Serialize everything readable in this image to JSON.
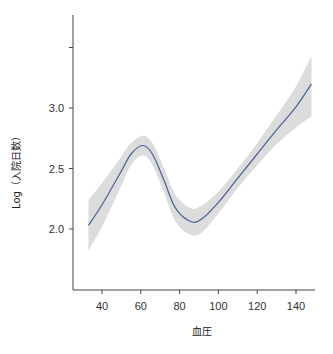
{
  "chart_data": {
    "type": "line",
    "subtype": "smoothed line with confidence band",
    "title": "",
    "xlabel": "血圧",
    "ylabel": "Log（入院日数）",
    "xlim": [
      26,
      152
    ],
    "ylim": [
      1.5,
      3.6
    ],
    "x_ticks": [
      40,
      60,
      80,
      100,
      120,
      140
    ],
    "y_ticks": [
      2.0,
      2.5,
      3.0,
      3.5
    ],
    "y_tick_labels": [
      "2.0",
      "2.5",
      "3.0",
      ""
    ],
    "grid": false,
    "legend": null,
    "series": [
      {
        "name": "fit",
        "color": "#4a5f9a",
        "x": [
          33,
          40,
          50,
          55,
          61,
          66,
          72,
          78,
          86,
          92,
          100,
          110,
          120,
          130,
          140,
          148
        ],
        "y": [
          2.03,
          2.2,
          2.48,
          2.62,
          2.69,
          2.62,
          2.4,
          2.17,
          2.06,
          2.09,
          2.22,
          2.42,
          2.62,
          2.82,
          3.01,
          3.2
        ],
        "lower": [
          1.82,
          2.02,
          2.36,
          2.53,
          2.61,
          2.53,
          2.3,
          2.06,
          1.95,
          1.98,
          2.13,
          2.34,
          2.53,
          2.7,
          2.84,
          2.93
        ],
        "upper": [
          2.24,
          2.38,
          2.6,
          2.71,
          2.77,
          2.71,
          2.5,
          2.28,
          2.17,
          2.2,
          2.31,
          2.5,
          2.71,
          2.94,
          3.18,
          3.43
        ]
      }
    ],
    "band_color": "#dcdcdc"
  }
}
